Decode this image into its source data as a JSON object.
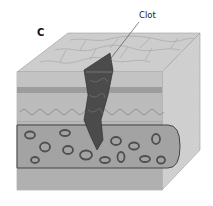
{
  "figure": {
    "panel_letter": "C",
    "labels": [
      {
        "text": "Clot",
        "target": "clot"
      }
    ],
    "structures": [
      "tissue-block",
      "blood-vessel",
      "red-blood-cells",
      "clot"
    ],
    "colors": {
      "top_face": "#c9c9c9",
      "front_face": "#b5b5b5",
      "side_face": "#d4d4d4",
      "vessel_interior": "#9a9a9a",
      "clot": "#4a4a4a",
      "cell": "#6a6a6a"
    }
  }
}
